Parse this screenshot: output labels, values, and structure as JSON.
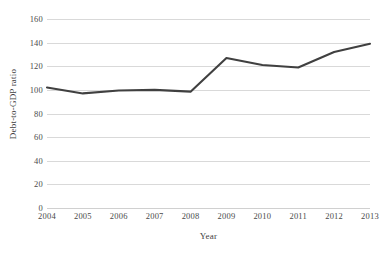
{
  "chart_data": {
    "type": "line",
    "title": "",
    "xlabel": "Year",
    "ylabel": "Debt-to-GDP ratio",
    "categories": [
      "2004",
      "2005",
      "2006",
      "2007",
      "2008",
      "2009",
      "2010",
      "2011",
      "2012",
      "2013"
    ],
    "values": [
      102,
      97,
      99.5,
      100,
      98.5,
      127,
      121,
      119,
      132,
      139
    ],
    "series": [
      {
        "name": "Debt-to-GDP ratio",
        "values": [
          102,
          97,
          99.5,
          100,
          98.5,
          127,
          121,
          119,
          132,
          139
        ]
      }
    ],
    "ylim": [
      0,
      160
    ],
    "ytick_values": [
      0,
      20,
      40,
      60,
      80,
      100,
      120,
      140,
      160
    ],
    "ytick_labels": [
      "0",
      "20",
      "40",
      "60",
      "80",
      "100",
      "120",
      "140",
      "160"
    ],
    "grid": "horizontal",
    "legend": "none",
    "line_color": "#404040",
    "gridline_color": "#d9d9d9",
    "background_color": "#ffffff"
  }
}
